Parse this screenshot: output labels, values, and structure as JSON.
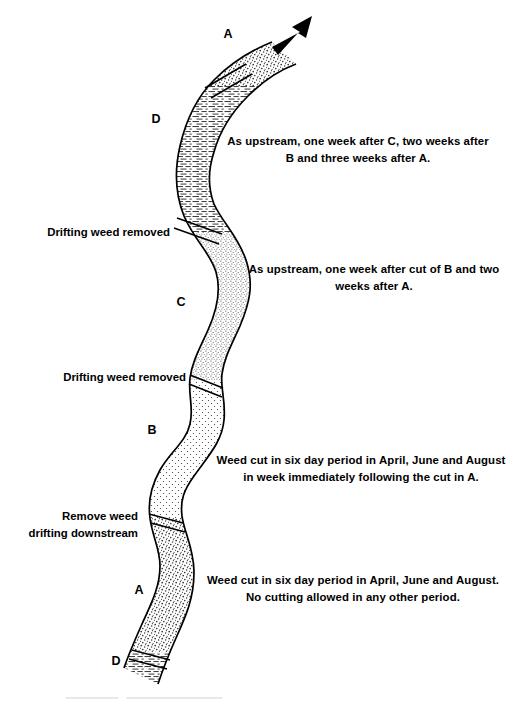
{
  "diagram": {
    "flow_arrow": "flow-direction-arrow",
    "colors": {
      "ink": "#000000",
      "stipple_fill": "#e8e6e2",
      "dash_fill": "#f2f1ee",
      "dot_fill": "#f6f5f3",
      "paper": "#ffffff"
    }
  },
  "reach_labels": [
    {
      "id": "A-top",
      "text": "A",
      "x": 228,
      "y": 32
    },
    {
      "id": "D-upper",
      "text": "D",
      "x": 156,
      "y": 117
    },
    {
      "id": "C",
      "text": "C",
      "x": 181,
      "y": 300
    },
    {
      "id": "B",
      "text": "B",
      "x": 152,
      "y": 428
    },
    {
      "id": "A-lower",
      "text": "A",
      "x": 139,
      "y": 588
    },
    {
      "id": "D-lower",
      "text": "D",
      "x": 116,
      "y": 659
    }
  ],
  "left_labels": [
    {
      "id": "drifting-weed-removed-upper",
      "text": "Drifting weed removed",
      "x": 22,
      "y": 224,
      "width": 148
    },
    {
      "id": "drifting-weed-removed-lower",
      "text": "Drifting weed removed",
      "x": 38,
      "y": 369,
      "width": 148
    },
    {
      "id": "remove-weed-drifting-downstream",
      "text": "Remove weed\ndrifting downstream",
      "x": 16,
      "y": 508,
      "width": 122
    }
  ],
  "notes": [
    {
      "id": "note-d-upper",
      "text": "As upstream, one week after C, two weeks after\nB and three weeks after A.",
      "x": 208,
      "y": 133,
      "width": 300
    },
    {
      "id": "note-c",
      "text": "As upstream, one week after cut of B and two\nweeks after A.",
      "x": 230,
      "y": 261,
      "width": 288
    },
    {
      "id": "note-b",
      "text": "Weed cut in six day period in April, June and August\nin week immediately following the cut in A.",
      "x": 202,
      "y": 452,
      "width": 318
    },
    {
      "id": "note-a-lower",
      "text": "Weed cut in six day period in April, June and August.\nNo cutting allowed in any other period.",
      "x": 188,
      "y": 572,
      "width": 330
    }
  ],
  "reaches": [
    {
      "id": "reach-a-top",
      "letter": "A",
      "texture": "stipple-coarse"
    },
    {
      "id": "reach-d-upper",
      "letter": "D",
      "texture": "horizontal-dashes"
    },
    {
      "id": "reach-c",
      "letter": "C",
      "texture": "stipple-fine"
    },
    {
      "id": "reach-b",
      "letter": "B",
      "texture": "dot-grid"
    },
    {
      "id": "reach-a-lower",
      "letter": "A",
      "texture": "stipple-coarse"
    },
    {
      "id": "reach-d-lower",
      "letter": "D",
      "texture": "horizontal-dashes"
    }
  ],
  "caption": {
    "text": ""
  }
}
